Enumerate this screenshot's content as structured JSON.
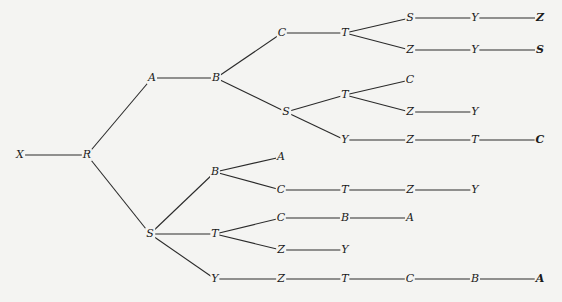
{
  "diagram": {
    "type": "tree",
    "colors": {
      "background": "#f4f4f2",
      "line": "#2a2a2a",
      "text": "#1a1a1a"
    },
    "nodes": [
      {
        "id": "n0",
        "label": "X",
        "x": 20,
        "y": 155
      },
      {
        "id": "n1",
        "label": "R",
        "x": 87,
        "y": 155
      },
      {
        "id": "n2",
        "label": "A",
        "x": 152,
        "y": 78
      },
      {
        "id": "n3",
        "label": "B",
        "x": 216,
        "y": 78
      },
      {
        "id": "n4",
        "label": "C",
        "x": 282,
        "y": 33
      },
      {
        "id": "n5",
        "label": "T",
        "x": 345,
        "y": 33
      },
      {
        "id": "n6",
        "label": "S",
        "x": 410,
        "y": 18
      },
      {
        "id": "n7",
        "label": "Y",
        "x": 475,
        "y": 18
      },
      {
        "id": "n8",
        "label": "Z",
        "x": 540,
        "y": 18,
        "bold": true
      },
      {
        "id": "n9",
        "label": "Z",
        "x": 410,
        "y": 50
      },
      {
        "id": "n10",
        "label": "Y",
        "x": 475,
        "y": 50
      },
      {
        "id": "n11",
        "label": "S",
        "x": 540,
        "y": 50,
        "bold": true
      },
      {
        "id": "n12",
        "label": "S",
        "x": 286,
        "y": 112
      },
      {
        "id": "n13",
        "label": "T",
        "x": 345,
        "y": 95
      },
      {
        "id": "n14",
        "label": "C",
        "x": 410,
        "y": 80
      },
      {
        "id": "n15",
        "label": "Z",
        "x": 410,
        "y": 112
      },
      {
        "id": "n16",
        "label": "Y",
        "x": 475,
        "y": 112
      },
      {
        "id": "n17",
        "label": "Y",
        "x": 345,
        "y": 140
      },
      {
        "id": "n18",
        "label": "Z",
        "x": 410,
        "y": 140
      },
      {
        "id": "n19",
        "label": "T",
        "x": 475,
        "y": 140
      },
      {
        "id": "n20",
        "label": "C",
        "x": 540,
        "y": 140,
        "bold": true
      },
      {
        "id": "n21",
        "label": "S",
        "x": 150,
        "y": 234
      },
      {
        "id": "n22",
        "label": "B",
        "x": 215,
        "y": 172
      },
      {
        "id": "n23",
        "label": "A",
        "x": 281,
        "y": 157
      },
      {
        "id": "n24",
        "label": "C",
        "x": 281,
        "y": 190
      },
      {
        "id": "n25",
        "label": "T",
        "x": 345,
        "y": 190
      },
      {
        "id": "n26",
        "label": "Z",
        "x": 410,
        "y": 190
      },
      {
        "id": "n27",
        "label": "Y",
        "x": 475,
        "y": 190
      },
      {
        "id": "n28",
        "label": "T",
        "x": 215,
        "y": 234
      },
      {
        "id": "n29",
        "label": "C",
        "x": 281,
        "y": 218
      },
      {
        "id": "n30",
        "label": "B",
        "x": 345,
        "y": 218
      },
      {
        "id": "n31",
        "label": "A",
        "x": 410,
        "y": 218
      },
      {
        "id": "n32",
        "label": "Z",
        "x": 281,
        "y": 250
      },
      {
        "id": "n33",
        "label": "Y",
        "x": 345,
        "y": 250
      },
      {
        "id": "n34",
        "label": "Y",
        "x": 215,
        "y": 279
      },
      {
        "id": "n35",
        "label": "Z",
        "x": 281,
        "y": 279
      },
      {
        "id": "n36",
        "label": "T",
        "x": 345,
        "y": 279
      },
      {
        "id": "n37",
        "label": "C",
        "x": 410,
        "y": 279
      },
      {
        "id": "n38",
        "label": "B",
        "x": 475,
        "y": 279
      },
      {
        "id": "n39",
        "label": "A",
        "x": 540,
        "y": 279,
        "bold": true
      }
    ],
    "edges": [
      [
        "n0",
        "n1"
      ],
      [
        "n1",
        "n2"
      ],
      [
        "n2",
        "n3"
      ],
      [
        "n3",
        "n4"
      ],
      [
        "n4",
        "n5"
      ],
      [
        "n5",
        "n6"
      ],
      [
        "n6",
        "n7"
      ],
      [
        "n7",
        "n8"
      ],
      [
        "n5",
        "n9"
      ],
      [
        "n9",
        "n10"
      ],
      [
        "n10",
        "n11"
      ],
      [
        "n3",
        "n12"
      ],
      [
        "n12",
        "n13"
      ],
      [
        "n13",
        "n14"
      ],
      [
        "n13",
        "n15"
      ],
      [
        "n15",
        "n16"
      ],
      [
        "n12",
        "n17"
      ],
      [
        "n17",
        "n18"
      ],
      [
        "n18",
        "n19"
      ],
      [
        "n19",
        "n20"
      ],
      [
        "n1",
        "n21"
      ],
      [
        "n21",
        "n22"
      ],
      [
        "n22",
        "n23"
      ],
      [
        "n22",
        "n24"
      ],
      [
        "n24",
        "n25"
      ],
      [
        "n25",
        "n26"
      ],
      [
        "n26",
        "n27"
      ],
      [
        "n21",
        "n28"
      ],
      [
        "n28",
        "n29"
      ],
      [
        "n29",
        "n30"
      ],
      [
        "n30",
        "n31"
      ],
      [
        "n28",
        "n32"
      ],
      [
        "n32",
        "n33"
      ],
      [
        "n21",
        "n34"
      ],
      [
        "n34",
        "n35"
      ],
      [
        "n35",
        "n36"
      ],
      [
        "n36",
        "n37"
      ],
      [
        "n37",
        "n38"
      ],
      [
        "n38",
        "n39"
      ]
    ]
  }
}
